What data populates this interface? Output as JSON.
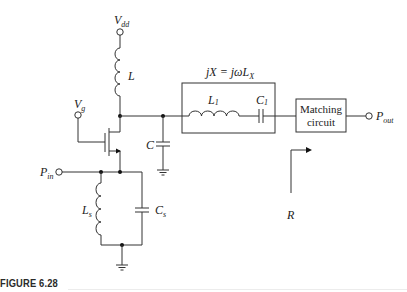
{
  "figure": {
    "caption": "FIGURE 6.28"
  },
  "labels": {
    "vdd": {
      "main": "V",
      "sub": "dd"
    },
    "vg": {
      "main": "V",
      "sub": "g"
    },
    "l": "L",
    "c": "C",
    "pin": {
      "main": "P",
      "sub": "in"
    },
    "ls": {
      "main": "L",
      "sub": "s"
    },
    "cs": {
      "main": "C",
      "sub": "s"
    },
    "l1": {
      "main": "L",
      "sub": "1"
    },
    "c1": {
      "main": "C",
      "sub": "1"
    },
    "reactance": {
      "main": "jX = jωL",
      "sub": "X"
    },
    "matching": {
      "line1": "Matching",
      "line2": "circuit"
    },
    "pout": {
      "main": "P",
      "sub": "out"
    },
    "r": "R"
  },
  "colors": {
    "line": "#333333",
    "text": "#222222",
    "background": "#ffffff"
  }
}
